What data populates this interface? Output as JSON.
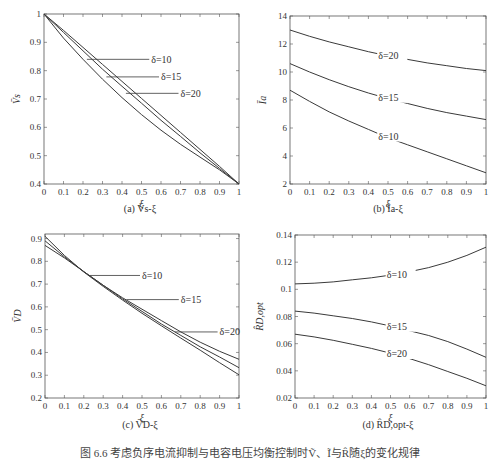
{
  "figure": {
    "caption": "图 6.6  考虑负序电流抑制与电容电压均衡控制时Ṽ、Ĩ与R̂随ξ的变化规律",
    "caption_visible_note": "caption text truncated at bottom edge"
  },
  "chart_data": [
    {
      "id": "a",
      "type": "line",
      "subtitle": "(a)  V̄s-ξ",
      "xlabel": "ξ",
      "ylabel": "V̄s",
      "xlim": [
        0,
        1
      ],
      "ylim": [
        0.4,
        1.0
      ],
      "xticks": [
        "0",
        "0.1",
        "0.2",
        "0.3",
        "0.4",
        "0.5",
        "0.6",
        "0.7",
        "0.8",
        "0.9",
        "1"
      ],
      "yticks": [
        "0.4",
        "0.5",
        "0.6",
        "0.7",
        "0.8",
        "0.9",
        "1"
      ],
      "yticks_values": [
        0.4,
        0.5,
        0.6,
        0.7,
        0.8,
        0.9,
        1.0
      ],
      "grid": false,
      "x": [
        0,
        0.1,
        0.2,
        0.3,
        0.4,
        0.5,
        0.6,
        0.7,
        0.8,
        0.9,
        1.0
      ],
      "series": [
        {
          "name": "δ=10",
          "values": [
            1.0,
            0.915,
            0.84,
            0.77,
            0.705,
            0.645,
            0.59,
            0.54,
            0.495,
            0.45,
            0.4
          ]
        },
        {
          "name": "δ=15",
          "values": [
            1.0,
            0.935,
            0.87,
            0.805,
            0.745,
            0.685,
            0.625,
            0.568,
            0.51,
            0.455,
            0.4
          ]
        },
        {
          "name": "δ=20",
          "values": [
            1.0,
            0.942,
            0.882,
            0.822,
            0.762,
            0.702,
            0.642,
            0.582,
            0.522,
            0.462,
            0.4
          ]
        }
      ],
      "annotations": [
        {
          "text": "δ=10",
          "point_x": 0.22,
          "point_y": 0.84,
          "label_x": 0.55,
          "label_y": 0.84
        },
        {
          "text": "δ=15",
          "point_x": 0.32,
          "point_y": 0.778,
          "label_x": 0.6,
          "label_y": 0.778
        },
        {
          "text": "δ=20",
          "point_x": 0.42,
          "point_y": 0.72,
          "label_x": 0.7,
          "label_y": 0.72
        }
      ]
    },
    {
      "id": "b",
      "type": "line",
      "subtitle": "(b)  Īa-ξ",
      "xlabel": "ξ",
      "ylabel": "Īa",
      "xlim": [
        0,
        1
      ],
      "ylim": [
        2,
        14
      ],
      "xticks": [
        "0",
        "0.1",
        "0.2",
        "0.3",
        "0.4",
        "0.5",
        "0.6",
        "0.7",
        "0.8",
        "0.9",
        "1"
      ],
      "yticks": [
        "2",
        "4",
        "6",
        "8",
        "10",
        "12",
        "14"
      ],
      "yticks_values": [
        2,
        4,
        6,
        8,
        10,
        12,
        14
      ],
      "grid": false,
      "x": [
        0,
        0.1,
        0.2,
        0.3,
        0.4,
        0.5,
        0.6,
        0.7,
        0.8,
        0.9,
        1.0
      ],
      "series": [
        {
          "name": "δ=20",
          "values": [
            13.0,
            12.55,
            12.15,
            11.8,
            11.45,
            11.15,
            10.9,
            10.65,
            10.45,
            10.25,
            10.1
          ]
        },
        {
          "name": "δ=15",
          "values": [
            10.6,
            10.0,
            9.45,
            8.95,
            8.5,
            8.1,
            7.75,
            7.4,
            7.1,
            6.85,
            6.6
          ]
        },
        {
          "name": "δ=10",
          "values": [
            8.7,
            7.9,
            7.15,
            6.5,
            5.9,
            5.3,
            4.8,
            4.3,
            3.8,
            3.3,
            2.8
          ]
        }
      ],
      "annotations": [
        {
          "text": "δ=20",
          "inline_x": 0.45
        },
        {
          "text": "δ=15",
          "inline_x": 0.45
        },
        {
          "text": "δ=10",
          "inline_x": 0.45
        }
      ]
    },
    {
      "id": "c",
      "type": "line",
      "subtitle": "(c)  V̄D-ξ",
      "xlabel": "ξ",
      "ylabel": "V̄D",
      "xlim": [
        0,
        1
      ],
      "ylim": [
        0.2,
        0.92
      ],
      "xticks": [
        "0",
        "0.1",
        "0.2",
        "0.3",
        "0.4",
        "0.5",
        "0.6",
        "0.7",
        "0.8",
        "0.9",
        "1"
      ],
      "yticks": [
        "0.2",
        "0.3",
        "0.4",
        "0.5",
        "0.6",
        "0.7",
        "0.8",
        "0.9"
      ],
      "yticks_values": [
        0.2,
        0.3,
        0.4,
        0.5,
        0.6,
        0.7,
        0.8,
        0.9
      ],
      "grid": false,
      "x": [
        0,
        0.1,
        0.2,
        0.3,
        0.4,
        0.5,
        0.6,
        0.7,
        0.8,
        0.9,
        1.0
      ],
      "series": [
        {
          "name": "δ=10",
          "values": [
            0.87,
            0.815,
            0.755,
            0.695,
            0.64,
            0.59,
            0.54,
            0.49,
            0.445,
            0.405,
            0.37
          ]
        },
        {
          "name": "δ=15",
          "values": [
            0.89,
            0.82,
            0.755,
            0.695,
            0.635,
            0.58,
            0.525,
            0.475,
            0.425,
            0.38,
            0.333
          ]
        },
        {
          "name": "δ=20",
          "values": [
            0.91,
            0.826,
            0.753,
            0.69,
            0.63,
            0.572,
            0.517,
            0.463,
            0.41,
            0.355,
            0.302
          ]
        }
      ],
      "annotations": [
        {
          "text": "δ=10",
          "point_x": 0.23,
          "point_y": 0.738,
          "label_x": 0.5,
          "label_y": 0.738
        },
        {
          "text": "δ=15",
          "point_x": 0.42,
          "point_y": 0.632,
          "label_x": 0.7,
          "label_y": 0.632
        },
        {
          "text": "δ=20",
          "point_x": 0.67,
          "point_y": 0.49,
          "label_x": 0.9,
          "label_y": 0.49
        }
      ]
    },
    {
      "id": "d",
      "type": "line",
      "subtitle": "(d)  R̂D,opt-ξ",
      "xlabel": "ξ",
      "ylabel": "R̂D,opt",
      "xlim": [
        0,
        1
      ],
      "ylim": [
        0.02,
        0.14
      ],
      "xticks": [
        "0",
        "0.1",
        "0.2",
        "0.3",
        "0.4",
        "0.5",
        "0.6",
        "0.7",
        "0.8",
        "0.9",
        "1"
      ],
      "yticks": [
        "0.02",
        "0.04",
        "0.06",
        "0.08",
        "0.1",
        "0.12",
        "0.14"
      ],
      "yticks_values": [
        0.02,
        0.04,
        0.06,
        0.08,
        0.1,
        0.12,
        0.14
      ],
      "grid": false,
      "x": [
        0,
        0.1,
        0.2,
        0.3,
        0.4,
        0.5,
        0.6,
        0.7,
        0.8,
        0.9,
        1.0
      ],
      "series": [
        {
          "name": "δ=10",
          "values": [
            0.104,
            0.1045,
            0.1055,
            0.107,
            0.1085,
            0.1105,
            0.113,
            0.116,
            0.12,
            0.125,
            0.131
          ]
        },
        {
          "name": "δ=15",
          "values": [
            0.084,
            0.0825,
            0.0805,
            0.0785,
            0.076,
            0.073,
            0.0695,
            0.066,
            0.0615,
            0.056,
            0.05
          ]
        },
        {
          "name": "δ=20",
          "values": [
            0.067,
            0.065,
            0.0625,
            0.0595,
            0.0565,
            0.053,
            0.049,
            0.0445,
            0.0395,
            0.0345,
            0.029
          ]
        }
      ],
      "annotations": [
        {
          "text": "δ=10",
          "inline_x": 0.48
        },
        {
          "text": "δ=15",
          "inline_x": 0.48
        },
        {
          "text": "δ=20",
          "inline_x": 0.48
        }
      ]
    }
  ],
  "layout": {
    "plots": [
      {
        "left": 44,
        "top": 14,
        "right": 239,
        "bottom": 184,
        "caption_top": 203,
        "caption_center": 140
      },
      {
        "left": 290,
        "top": 16,
        "right": 486,
        "bottom": 184,
        "caption_top": 203,
        "caption_center": 388
      },
      {
        "left": 45,
        "top": 234,
        "right": 239,
        "bottom": 398,
        "caption_top": 419,
        "caption_center": 140
      },
      {
        "left": 295,
        "top": 235,
        "right": 486,
        "bottom": 398,
        "caption_top": 419,
        "caption_center": 388
      }
    ],
    "line_color": "#3a3a3a",
    "axis_color": "#555555",
    "text_color": "#333333"
  }
}
